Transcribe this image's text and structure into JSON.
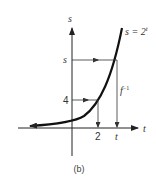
{
  "figure": {
    "caption": "(b)",
    "axes": {
      "x_label": "t",
      "y_label": "s"
    },
    "curve_label": "s = 2",
    "curve_label_exponent": "t",
    "inverse_label": "f",
    "inverse_label_exponent": "−1",
    "y_ticks": [
      "s",
      "4"
    ],
    "x_ticks": [
      "2",
      "t"
    ],
    "colors": {
      "ink": "#222222",
      "background": "#ffffff"
    }
  }
}
